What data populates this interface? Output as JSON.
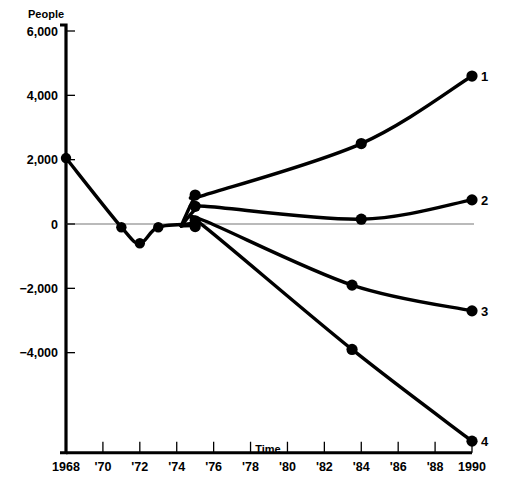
{
  "chart_data": {
    "type": "line",
    "title": "",
    "xlabel": "Time",
    "ylabel": "People",
    "xlim": [
      1968,
      1990
    ],
    "ylim": [
      -6800,
      6000
    ],
    "grid": false,
    "zero_line": true,
    "legend": "endpoint-labels-at-right",
    "x_tick_labels": [
      "1968",
      "'70",
      "'72",
      "'74",
      "'76",
      "'78",
      "'80",
      "'82",
      "'84",
      "'86",
      "'88",
      "1990"
    ],
    "x_tick_values": [
      1968,
      1970,
      1972,
      1974,
      1976,
      1978,
      1980,
      1982,
      1984,
      1986,
      1988,
      1990
    ],
    "y_tick_labels": [
      "6,000",
      "4,000",
      "2,000",
      "0",
      "−2,000",
      "−4,000"
    ],
    "y_tick_values": [
      6000,
      4000,
      2000,
      0,
      -2000,
      -4000
    ],
    "trunk": {
      "name": "common-history",
      "x": [
        1968,
        1971,
        1972,
        1973,
        1975
      ],
      "values": [
        2050,
        -100,
        -600,
        -100,
        0
      ]
    },
    "series": [
      {
        "name": "1",
        "label": "1",
        "x": [
          1975,
          1975.5,
          1984,
          1990
        ],
        "values": [
          850,
          900,
          2500,
          4600
        ],
        "markers_x": [
          1975,
          1984,
          1990
        ],
        "markers_values": [
          900,
          2500,
          4600
        ]
      },
      {
        "name": "2",
        "label": "2",
        "x": [
          1975,
          1975.5,
          1984,
          1990
        ],
        "values": [
          450,
          550,
          150,
          750
        ],
        "markers_x": [
          1975,
          1984,
          1990
        ],
        "markers_values": [
          550,
          150,
          750
        ]
      },
      {
        "name": "3",
        "label": "3",
        "x": [
          1975,
          1975.5,
          1983.5,
          1990
        ],
        "values": [
          50,
          100,
          -1900,
          -2700
        ],
        "markers_x": [
          1975,
          1983.5,
          1990
        ],
        "markers_values": [
          100,
          -1900,
          -2700
        ]
      },
      {
        "name": "4",
        "label": "4",
        "x": [
          1975,
          1975.5,
          1983.5,
          1990
        ],
        "values": [
          -50,
          -80,
          -3900,
          -6750
        ],
        "markers_x": [
          1975,
          1983.5,
          1990
        ],
        "markers_values": [
          -80,
          -3900,
          -6750
        ]
      }
    ],
    "series_end_labels": [
      "1",
      "2",
      "3",
      "4"
    ]
  }
}
